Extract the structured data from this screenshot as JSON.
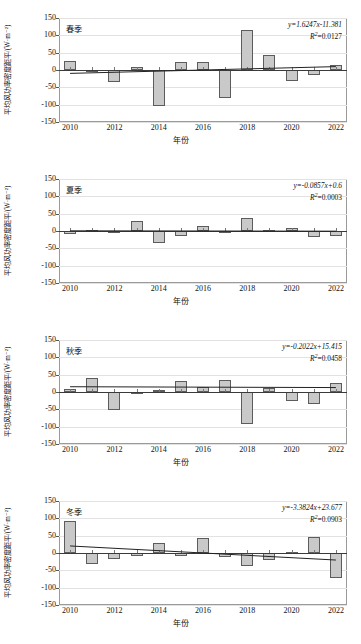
{
  "axis": {
    "y_label": "平均风功率密度距平/(W·m⁻²)",
    "x_label": "年份",
    "y_ticks": [
      "150",
      "100",
      "50",
      "0",
      "-50",
      "-100",
      "-150"
    ],
    "x_ticks": [
      "2010",
      "2012",
      "2014",
      "2016",
      "2018",
      "2020",
      "2022"
    ]
  },
  "chart_data": [
    {
      "type": "bar",
      "title": "春季",
      "xlabel": "年份",
      "ylabel": "平均风功率密度距平/(W·m⁻²)",
      "ylim": [
        -150,
        150
      ],
      "grid": true,
      "equation": "y=1.6247x-11.381",
      "r2_label": "R",
      "r2_sup": "2",
      "r2_value": "=0.0127",
      "trend": {
        "slope": 1.6247,
        "intercept": -11.381
      },
      "categories": [
        2010,
        2011,
        2012,
        2013,
        2014,
        2015,
        2016,
        2017,
        2018,
        2019,
        2020,
        2021,
        2022
      ],
      "values": [
        27,
        -2,
        -34,
        8,
        -105,
        23,
        24,
        -80,
        114,
        43,
        -33,
        -13,
        15
      ]
    },
    {
      "type": "bar",
      "title": "夏季",
      "xlabel": "年份",
      "ylabel": "平均风功率密度距平/(W·m⁻²)",
      "ylim": [
        -150,
        150
      ],
      "grid": true,
      "equation": "y=-0.0857x+0.6",
      "r2_label": "R",
      "r2_sup": "2",
      "r2_value": "=0.0003",
      "trend": {
        "slope": -0.0857,
        "intercept": 0.6
      },
      "categories": [
        2010,
        2011,
        2012,
        2013,
        2014,
        2015,
        2016,
        2017,
        2018,
        2019,
        2020,
        2021,
        2022
      ],
      "values": [
        -9,
        3,
        -5,
        29,
        -36,
        -15,
        13,
        -2,
        37,
        2,
        10,
        -16,
        -13
      ]
    },
    {
      "type": "bar",
      "title": "秋季",
      "xlabel": "年份",
      "ylabel": "平均风功率密度距平/(W·m⁻²)",
      "ylim": [
        -150,
        150
      ],
      "grid": true,
      "equation": "y=-0.2022x+15.415",
      "r2_label": "R",
      "r2_sup": "2",
      "r2_value": "=0.0458",
      "trend": {
        "slope": -0.2022,
        "intercept": 15.415
      },
      "categories": [
        2010,
        2011,
        2012,
        2013,
        2014,
        2015,
        2016,
        2017,
        2018,
        2019,
        2020,
        2021,
        2022
      ],
      "values": [
        10,
        40,
        -52,
        -4,
        7,
        33,
        13,
        34,
        -93,
        11,
        -26,
        -34,
        26
      ]
    },
    {
      "type": "bar",
      "title": "冬季",
      "xlabel": "年份",
      "ylabel": "平均风功率密度距平/(W·m⁻²)",
      "ylim": [
        -150,
        150
      ],
      "grid": true,
      "equation": "y=-3.3824x+23.677",
      "r2_label": "R",
      "r2_sup": "2",
      "r2_value": "=0.0903",
      "trend": {
        "slope": -3.3824,
        "intercept": 23.677
      },
      "categories": [
        2010,
        2011,
        2012,
        2013,
        2014,
        2015,
        2016,
        2017,
        2018,
        2019,
        2020,
        2021,
        2022
      ],
      "values": [
        91,
        -33,
        -17,
        -10,
        28,
        -10,
        43,
        -12,
        -38,
        -21,
        3,
        46,
        -72
      ]
    }
  ],
  "style": {
    "bar_fill": "#c9c9c9",
    "bar_stroke": "#5c5c5c",
    "grid_color": "#e2e2e2",
    "axis_color": "#9a9a9a",
    "trend_color": "#222222"
  }
}
